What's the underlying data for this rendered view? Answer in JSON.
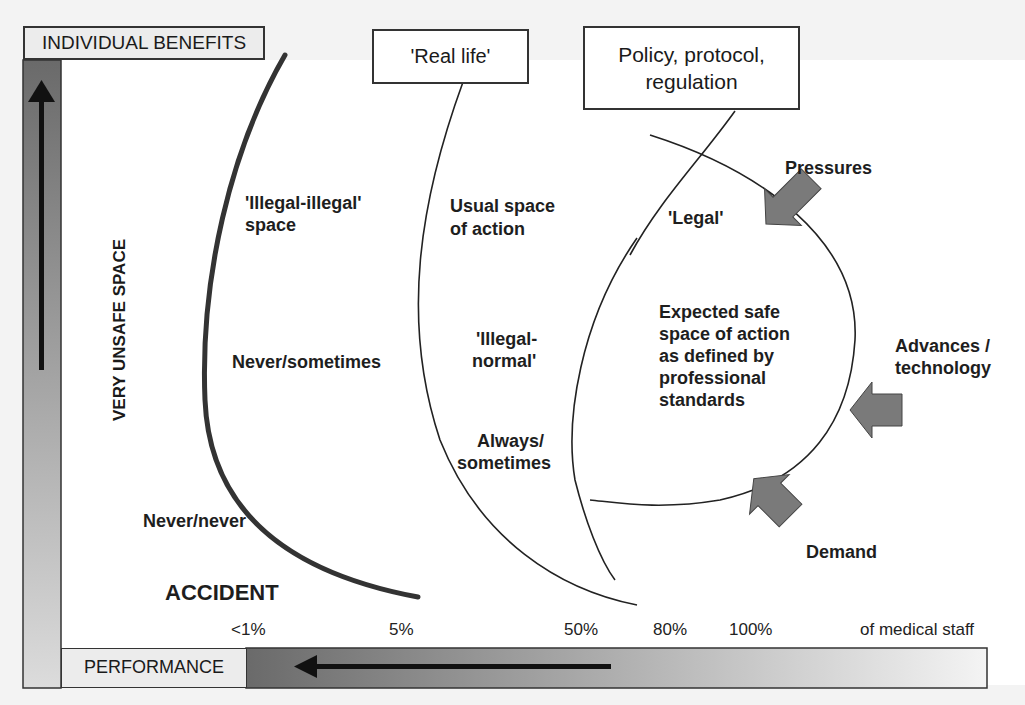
{
  "diagram": {
    "axes": {
      "y_label_box": "INDIVIDUAL BENEFITS",
      "x_label_box": "PERFORMANCE",
      "y_side_label": "VERY UNSAFE SPACE"
    },
    "boxes": {
      "real_life": "'Real life'",
      "policy_line1": "Policy, protocol,",
      "policy_line2": "regulation"
    },
    "regions": {
      "illegal_illegal_1": "'Illegal-illegal'",
      "illegal_illegal_2": "space",
      "usual_1": "Usual space",
      "usual_2": "of action",
      "illegal_normal_1": "'Illegal-",
      "illegal_normal_2": "normal'",
      "legal": "'Legal'",
      "expected_1": "Expected safe",
      "expected_2": "space of action",
      "expected_3": "as defined by",
      "expected_4": "professional",
      "expected_5": "standards",
      "never_sometimes": "Never/sometimes",
      "never_never": "Never/never",
      "always_1": "Always/",
      "always_2": "sometimes",
      "accident": "ACCIDENT"
    },
    "forces": {
      "pressures": "Pressures",
      "advances_1": "Advances /",
      "advances_2": "technology",
      "demand": "Demand"
    },
    "ticks": [
      "<1%",
      "5%",
      "50%",
      "80%",
      "100%"
    ],
    "ticks_suffix": "of medical staff",
    "colors": {
      "arrow_fill": "#777777",
      "bar_dark": "#666666",
      "bar_light": "#f0f0f0",
      "line": "#222222"
    }
  }
}
